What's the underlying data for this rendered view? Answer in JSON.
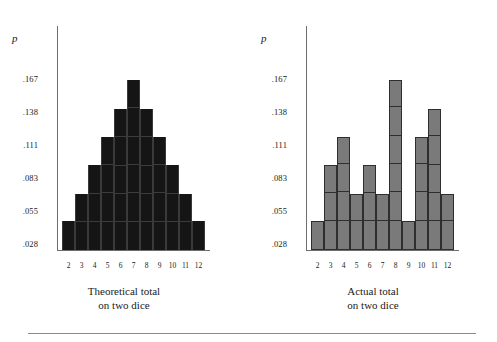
{
  "figure": {
    "axis_label_p": "p",
    "y_ticks": [
      ".167",
      ".138",
      ".111",
      ".083",
      ".055",
      ".028"
    ],
    "x_ticks": [
      "2",
      "3",
      "4",
      "5",
      "6",
      "7",
      "8",
      "9",
      "10",
      "11",
      "12"
    ],
    "colors": {
      "theoretical_bar": "#151515",
      "actual_bar": "#7a7a7a",
      "axis": "#6e6e6e",
      "rule": "#8a8a8a",
      "text": "#1a1a1a"
    },
    "left_caption_line1": "Theoretical total",
    "left_caption_line2": "on two dice",
    "right_caption_line1": "Actual total",
    "right_caption_line2": "on two dice"
  },
  "chart_data": [
    {
      "type": "bar",
      "title": "Theoretical total on two dice",
      "xlabel": "Theoretical total on two dice",
      "ylabel": "p",
      "categories": [
        "2",
        "3",
        "4",
        "5",
        "6",
        "7",
        "8",
        "9",
        "10",
        "11",
        "12"
      ],
      "values": [
        0.028,
        0.055,
        0.083,
        0.111,
        0.138,
        0.167,
        0.138,
        0.111,
        0.083,
        0.055,
        0.028
      ],
      "units": [
        1,
        2,
        3,
        4,
        5,
        6,
        5,
        4,
        3,
        2,
        1
      ],
      "ytick_values": [
        0.167,
        0.138,
        0.111,
        0.083,
        0.055,
        0.028
      ],
      "ytick_labels": [
        ".167",
        ".138",
        ".111",
        ".083",
        ".055",
        ".028"
      ],
      "ylim": [
        0,
        0.1805
      ],
      "grid": false,
      "legend": "none",
      "bar_color": "#151515"
    },
    {
      "type": "bar",
      "title": "Actual total on two dice",
      "xlabel": "Actual total on two dice",
      "ylabel": "p",
      "categories": [
        "2",
        "3",
        "4",
        "5",
        "6",
        "7",
        "8",
        "9",
        "10",
        "11",
        "12"
      ],
      "values": [
        0.028,
        0.083,
        0.111,
        0.055,
        0.083,
        0.055,
        0.167,
        0.028,
        0.111,
        0.138,
        0.055
      ],
      "units": [
        1,
        3,
        4,
        2,
        3,
        2,
        6,
        1,
        4,
        5,
        2
      ],
      "ytick_values": [
        0.167,
        0.138,
        0.111,
        0.083,
        0.055,
        0.028
      ],
      "ytick_labels": [
        ".167",
        ".138",
        ".111",
        ".083",
        ".055",
        ".028"
      ],
      "ylim": [
        0,
        0.1805
      ],
      "grid": false,
      "legend": "none",
      "bar_color": "#7a7a7a"
    }
  ]
}
